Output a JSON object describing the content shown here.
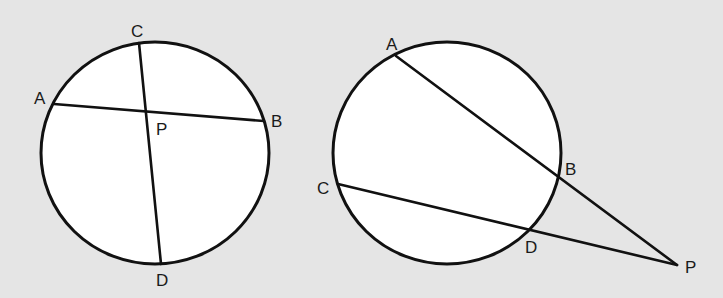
{
  "diagram": {
    "background": "#e5e5e5",
    "stroke_color": "#111111",
    "fill_color": "#ffffff",
    "figures": [
      {
        "name": "intersecting-chords",
        "circle": {
          "cx": 155,
          "cy": 153,
          "rx": 114,
          "ry": 111
        },
        "points": {
          "A": {
            "x": 54,
            "y": 104,
            "label": "A",
            "lx": 34,
            "ly": 104
          },
          "B": {
            "x": 264,
            "y": 121,
            "label": "B",
            "lx": 271,
            "ly": 127
          },
          "C": {
            "x": 139,
            "y": 43,
            "label": "C",
            "lx": 131,
            "ly": 37
          },
          "D": {
            "x": 161,
            "y": 264,
            "label": "D",
            "lx": 156,
            "ly": 286
          },
          "P": {
            "x": 148,
            "y": 112,
            "label": "P",
            "lx": 156,
            "ly": 135
          }
        },
        "segments": [
          [
            "A",
            "B"
          ],
          [
            "C",
            "D"
          ]
        ]
      },
      {
        "name": "secants-from-external-point",
        "circle": {
          "cx": 447,
          "cy": 153,
          "rx": 114,
          "ry": 111
        },
        "points": {
          "A": {
            "x": 396,
            "y": 56,
            "label": "A",
            "lx": 386,
            "ly": 50
          },
          "B": {
            "x": 558,
            "y": 176,
            "label": "B",
            "lx": 565,
            "ly": 175
          },
          "C": {
            "x": 338,
            "y": 184,
            "label": "C",
            "lx": 317,
            "ly": 194
          },
          "D": {
            "x": 529,
            "y": 230,
            "label": "D",
            "lx": 525,
            "ly": 253
          },
          "P": {
            "x": 677,
            "y": 265,
            "label": "P",
            "lx": 685,
            "ly": 273
          }
        },
        "segments": [
          [
            "A",
            "P"
          ],
          [
            "C",
            "P"
          ]
        ]
      }
    ]
  }
}
